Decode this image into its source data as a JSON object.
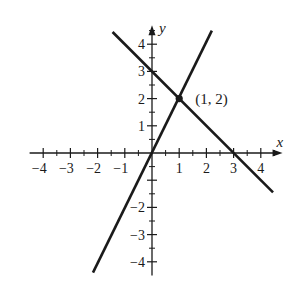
{
  "diagram": {
    "type": "coordinate-plane",
    "axes": {
      "x_label": "x",
      "y_label": "y",
      "x_range": [
        -4.5,
        4.8
      ],
      "y_range": [
        -4.5,
        4.7
      ],
      "x_ticks": [
        -4,
        -3,
        -2,
        -1,
        1,
        2,
        3,
        4
      ],
      "x_tick_labels": [
        "−4",
        "−3",
        "−2",
        "−1",
        "1",
        "2",
        "3",
        "4"
      ],
      "y_ticks": [
        4,
        3,
        2,
        1,
        -2,
        -3,
        -4
      ],
      "y_tick_labels": [
        "4",
        "3",
        "2",
        "1",
        "−2",
        "−3",
        "−4"
      ],
      "minor_tick_step": 0.5
    },
    "lines": [
      {
        "name": "line-y-equals-2x",
        "equation": "y = 2x",
        "from": [
          -2.17,
          -4.4
        ],
        "to": [
          2.2,
          4.5
        ]
      },
      {
        "name": "line-y-equals-neg-x-plus-3",
        "equation": "y = -x + 3",
        "from": [
          -1.45,
          4.45
        ],
        "to": [
          4.45,
          -1.45
        ]
      }
    ],
    "intersection": {
      "x": 1,
      "y": 2,
      "label": "(1, 2)"
    },
    "colors": {
      "ink": "#1a1a1a",
      "background": "#ffffff"
    }
  }
}
